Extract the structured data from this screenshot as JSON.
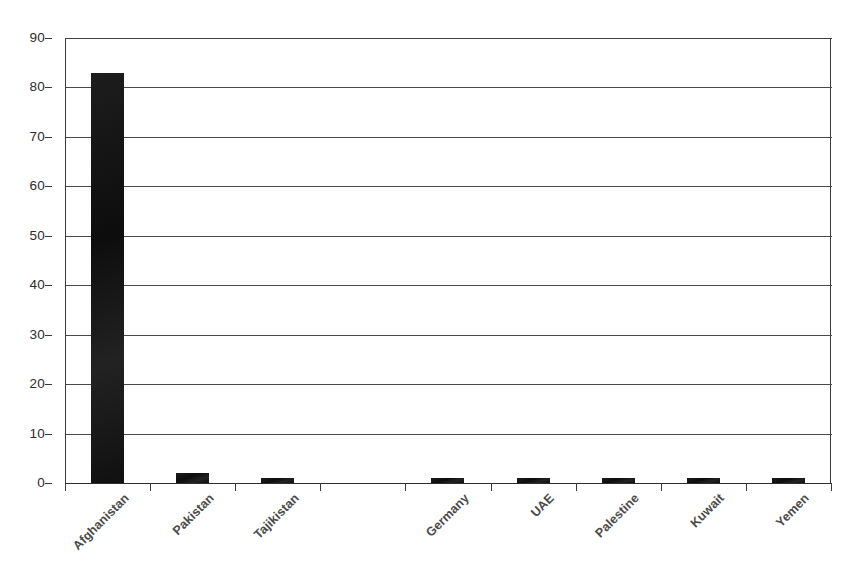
{
  "chart_data": {
    "type": "bar",
    "title": "",
    "subtitle": "",
    "xlabel": "",
    "ylabel": "",
    "categories": [
      "Afghanistan",
      "Pakistan",
      "Tajikistan",
      "",
      "Germany",
      "UAE",
      "Palestine",
      "Kuwait",
      "Yemen"
    ],
    "values": [
      83,
      2,
      1,
      0,
      1,
      1,
      1,
      1,
      1
    ],
    "ylim": [
      0,
      90
    ],
    "ytick_step": 10,
    "yticks": [
      90,
      80,
      70,
      60,
      50,
      40,
      30,
      20,
      10,
      0
    ],
    "ytick_labels": [
      "90",
      "80",
      "70",
      "60",
      "50",
      "40",
      "30",
      "20",
      "10",
      "0"
    ],
    "grid": "horizontal",
    "legend": "none",
    "orientation": "vertical",
    "bar_color": "#171717",
    "axis_color": "#3a3a3a",
    "background": "#ffffff",
    "label_rotation": -45,
    "series": [
      {
        "name": "Count",
        "values": [
          83,
          2,
          1,
          0,
          1,
          1,
          1,
          1,
          1
        ]
      }
    ]
  },
  "geometry": {
    "plot_left": 65,
    "plot_top": 38,
    "plot_width": 766,
    "plot_height": 445,
    "slot_width": 85.1,
    "bar_width": 33
  }
}
